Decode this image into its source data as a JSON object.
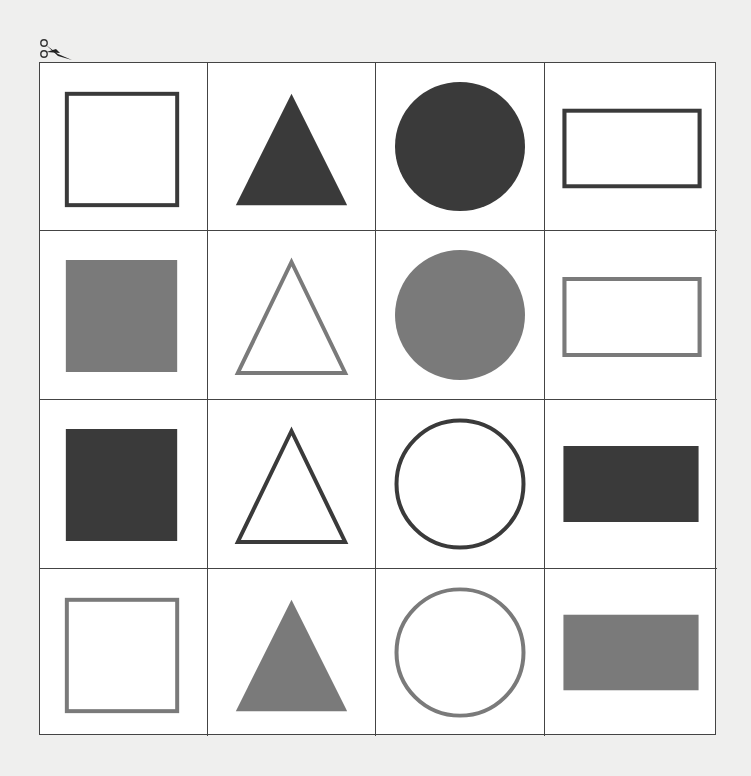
{
  "colors": {
    "dark": "#3a3a3a",
    "gray": "#7a7a7a",
    "background": "#efefee",
    "grid_line": "#444444",
    "cell": "#ffffff"
  },
  "icons": {
    "scissors": "scissors-icon"
  },
  "grid": {
    "rows": 4,
    "cols": 4,
    "cells": [
      [
        {
          "shape": "square",
          "style": "outline",
          "color": "dark"
        },
        {
          "shape": "triangle",
          "style": "filled",
          "color": "dark"
        },
        {
          "shape": "circle",
          "style": "filled",
          "color": "dark"
        },
        {
          "shape": "rectangle",
          "style": "outline",
          "color": "dark"
        }
      ],
      [
        {
          "shape": "square",
          "style": "filled",
          "color": "gray"
        },
        {
          "shape": "triangle",
          "style": "outline",
          "color": "gray"
        },
        {
          "shape": "circle",
          "style": "filled",
          "color": "gray"
        },
        {
          "shape": "rectangle",
          "style": "outline",
          "color": "gray"
        }
      ],
      [
        {
          "shape": "square",
          "style": "filled",
          "color": "dark"
        },
        {
          "shape": "triangle",
          "style": "outline",
          "color": "dark"
        },
        {
          "shape": "circle",
          "style": "outline",
          "color": "dark"
        },
        {
          "shape": "rectangle",
          "style": "filled",
          "color": "dark"
        }
      ],
      [
        {
          "shape": "square",
          "style": "outline",
          "color": "gray"
        },
        {
          "shape": "triangle",
          "style": "filled",
          "color": "gray"
        },
        {
          "shape": "circle",
          "style": "outline",
          "color": "gray"
        },
        {
          "shape": "rectangle",
          "style": "filled",
          "color": "gray"
        }
      ]
    ]
  }
}
